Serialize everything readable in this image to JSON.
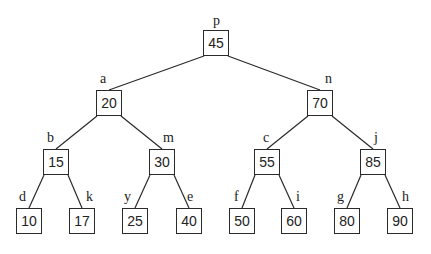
{
  "diagram": {
    "type": "binary-search-tree",
    "nodes": [
      {
        "id": "p",
        "label": "p",
        "value": "45",
        "x": 203,
        "y": 30,
        "lx": 213,
        "ly": 14
      },
      {
        "id": "a",
        "label": "a",
        "value": "20",
        "x": 96,
        "y": 90,
        "lx": 100,
        "ly": 72
      },
      {
        "id": "n",
        "label": "n",
        "value": "70",
        "x": 307,
        "y": 90,
        "lx": 325,
        "ly": 72
      },
      {
        "id": "b",
        "label": "b",
        "value": "15",
        "x": 43,
        "y": 149,
        "lx": 47,
        "ly": 131
      },
      {
        "id": "m",
        "label": "m",
        "value": "30",
        "x": 149,
        "y": 149,
        "lx": 163,
        "ly": 131
      },
      {
        "id": "c",
        "label": "c",
        "value": "55",
        "x": 254,
        "y": 149,
        "lx": 263,
        "ly": 131
      },
      {
        "id": "j",
        "label": "j",
        "value": "85",
        "x": 360,
        "y": 149,
        "lx": 374,
        "ly": 131
      },
      {
        "id": "d",
        "label": "d",
        "value": "10",
        "x": 16,
        "y": 208,
        "lx": 19,
        "ly": 190
      },
      {
        "id": "k",
        "label": "k",
        "value": "17",
        "x": 69,
        "y": 208,
        "lx": 86,
        "ly": 190
      },
      {
        "id": "y",
        "label": "y",
        "value": "25",
        "x": 122,
        "y": 208,
        "lx": 124,
        "ly": 190
      },
      {
        "id": "e",
        "label": "e",
        "value": "40",
        "x": 176,
        "y": 208,
        "lx": 187,
        "ly": 190
      },
      {
        "id": "f",
        "label": "f",
        "value": "50",
        "x": 229,
        "y": 208,
        "lx": 234,
        "ly": 190
      },
      {
        "id": "i",
        "label": "i",
        "value": "60",
        "x": 281,
        "y": 208,
        "lx": 296,
        "ly": 190
      },
      {
        "id": "g",
        "label": "g",
        "value": "80",
        "x": 334,
        "y": 208,
        "lx": 337,
        "ly": 190
      },
      {
        "id": "h",
        "label": "h",
        "value": "90",
        "x": 387,
        "y": 208,
        "lx": 402,
        "ly": 190
      }
    ],
    "edges": [
      [
        "p",
        "a"
      ],
      [
        "p",
        "n"
      ],
      [
        "a",
        "b"
      ],
      [
        "a",
        "m"
      ],
      [
        "n",
        "c"
      ],
      [
        "n",
        "j"
      ],
      [
        "b",
        "d"
      ],
      [
        "b",
        "k"
      ],
      [
        "m",
        "y"
      ],
      [
        "m",
        "e"
      ],
      [
        "c",
        "f"
      ],
      [
        "c",
        "i"
      ],
      [
        "j",
        "g"
      ],
      [
        "j",
        "h"
      ]
    ]
  }
}
